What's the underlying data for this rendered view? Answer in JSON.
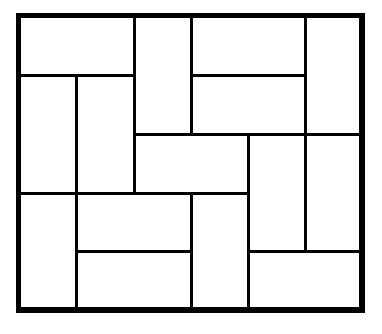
{
  "diagram": {
    "type": "rectangle-tiling",
    "grid": {
      "cols": 6,
      "rows": 5
    },
    "frame": {
      "x": 17,
      "y": 14,
      "width": 346,
      "height": 297
    },
    "line_color": "#000000",
    "fill_color": "#ffffff",
    "col_edges": [
      17,
      76,
      134,
      191,
      248,
      305,
      363
    ],
    "row_edges": [
      14,
      75,
      134,
      193,
      251,
      311
    ],
    "tiles": [
      {
        "id": 1,
        "orientation": "horizontal",
        "col": 0,
        "row": 0,
        "w": 2,
        "h": 1
      },
      {
        "id": 2,
        "orientation": "vertical",
        "col": 2,
        "row": 0,
        "w": 1,
        "h": 2
      },
      {
        "id": 3,
        "orientation": "horizontal",
        "col": 3,
        "row": 0,
        "w": 2,
        "h": 1
      },
      {
        "id": 4,
        "orientation": "vertical",
        "col": 5,
        "row": 0,
        "w": 1,
        "h": 2
      },
      {
        "id": 5,
        "orientation": "vertical",
        "col": 0,
        "row": 1,
        "w": 1,
        "h": 2
      },
      {
        "id": 6,
        "orientation": "vertical",
        "col": 1,
        "row": 1,
        "w": 1,
        "h": 2
      },
      {
        "id": 7,
        "orientation": "horizontal",
        "col": 3,
        "row": 1,
        "w": 2,
        "h": 1
      },
      {
        "id": 8,
        "orientation": "horizontal",
        "col": 2,
        "row": 2,
        "w": 2,
        "h": 1
      },
      {
        "id": 9,
        "orientation": "vertical",
        "col": 4,
        "row": 2,
        "w": 1,
        "h": 2
      },
      {
        "id": 10,
        "orientation": "vertical",
        "col": 5,
        "row": 2,
        "w": 1,
        "h": 2
      },
      {
        "id": 11,
        "orientation": "vertical",
        "col": 0,
        "row": 3,
        "w": 1,
        "h": 2
      },
      {
        "id": 12,
        "orientation": "horizontal",
        "col": 1,
        "row": 3,
        "w": 2,
        "h": 1
      },
      {
        "id": 13,
        "orientation": "vertical",
        "col": 3,
        "row": 3,
        "w": 1,
        "h": 2
      },
      {
        "id": 14,
        "orientation": "horizontal",
        "col": 1,
        "row": 4,
        "w": 2,
        "h": 1
      },
      {
        "id": 15,
        "orientation": "horizontal",
        "col": 4,
        "row": 4,
        "w": 2,
        "h": 1
      }
    ]
  }
}
